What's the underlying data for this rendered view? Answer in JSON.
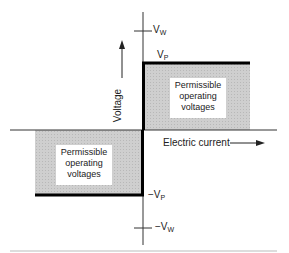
{
  "diagram": {
    "axes": {
      "y_label": "Voltage",
      "x_label": "Electric current"
    },
    "levels": {
      "vw_pos": {
        "main": "V",
        "sub": "W"
      },
      "vp_pos": {
        "main": "V",
        "sub": "P"
      },
      "vp_neg": {
        "prefix": "−",
        "main": "V",
        "sub": "P"
      },
      "vw_neg": {
        "prefix": "−",
        "main": "V",
        "sub": "W"
      }
    },
    "regions": [
      {
        "quadrant": "upper-right",
        "lines": [
          "Permissible",
          "operating",
          "voltages"
        ]
      },
      {
        "quadrant": "lower-left",
        "lines": [
          "Permissible",
          "operating",
          "voltages"
        ]
      }
    ],
    "colors": {
      "axis": "#222222",
      "boundary": "#000000",
      "shade": "#cfcfcf",
      "separator": "#bbbbbb"
    }
  }
}
